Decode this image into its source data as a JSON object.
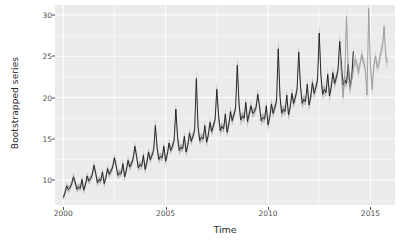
{
  "chart_data": {
    "type": "line",
    "title": "",
    "xlabel": "Time",
    "ylabel": "Bootstrapped series",
    "xlim": [
      1999.6,
      2016.2
    ],
    "ylim": [
      7.0,
      31.2
    ],
    "xticks": [
      2000,
      2005,
      2010,
      2015
    ],
    "xtick_labels": [
      "2000",
      "2005",
      "2010",
      "2015"
    ],
    "yticks": [
      10,
      15,
      20,
      25,
      30
    ],
    "ytick_labels": [
      "10",
      "15",
      "20",
      "25",
      "30"
    ],
    "grid": true,
    "grid_color": "#ffffff",
    "panel_background": "#ebebeb",
    "legend": "none",
    "series": [
      {
        "name": "observed",
        "color": "#1a1a1a",
        "ribbon_color": "#8c8c8c",
        "x_start": 2000.0,
        "x_end": 2013.5,
        "frequency": 12,
        "values": [
          7.9,
          8.4,
          9.3,
          8.9,
          9.1,
          9.6,
          10.4,
          9.8,
          8.9,
          9.2,
          9.0,
          10.1,
          8.8,
          9.4,
          10.5,
          9.9,
          10.2,
          10.6,
          11.8,
          10.9,
          9.7,
          10.1,
          9.9,
          11.0,
          9.6,
          10.3,
          11.4,
          10.7,
          11.1,
          11.6,
          12.7,
          11.8,
          10.6,
          10.9,
          10.8,
          12.0,
          10.4,
          11.2,
          12.4,
          11.6,
          12.0,
          12.6,
          14.1,
          12.9,
          11.5,
          11.9,
          11.7,
          13.0,
          11.3,
          12.1,
          13.4,
          12.5,
          13.0,
          13.6,
          16.6,
          14.0,
          12.5,
          12.9,
          12.7,
          14.1,
          12.3,
          13.1,
          14.5,
          13.6,
          14.1,
          14.8,
          18.6,
          15.2,
          13.6,
          14.0,
          13.8,
          15.3,
          13.4,
          14.2,
          15.7,
          14.7,
          15.3,
          16.0,
          22.3,
          16.5,
          14.8,
          15.2,
          15.0,
          16.6,
          14.6,
          15.4,
          17.0,
          15.9,
          16.6,
          17.3,
          21.0,
          17.9,
          16.0,
          16.5,
          16.2,
          18.0,
          15.8,
          16.7,
          18.3,
          17.2,
          17.9,
          18.7,
          23.9,
          19.3,
          17.3,
          17.8,
          17.5,
          19.4,
          17.1,
          18.0,
          19.0,
          18.1,
          18.3,
          18.8,
          20.4,
          19.0,
          17.2,
          17.6,
          17.4,
          19.0,
          16.7,
          17.6,
          19.2,
          18.1,
          18.8,
          19.6,
          25.9,
          20.2,
          18.1,
          18.6,
          18.3,
          20.3,
          17.9,
          18.8,
          20.5,
          19.3,
          20.0,
          20.9,
          25.5,
          21.5,
          19.3,
          19.8,
          19.5,
          21.6,
          19.1,
          20.0,
          21.8,
          20.5,
          21.2,
          22.1,
          27.8,
          22.7,
          20.4,
          21.0,
          20.6,
          22.8,
          20.2,
          21.2,
          23.0,
          21.7,
          22.4,
          23.3,
          26.8,
          23.9,
          21.5,
          22.1,
          21.7,
          24.0,
          21.3,
          22.3,
          25.6
        ]
      },
      {
        "name": "bootstrapped-forecast",
        "color": "#9a9a9a",
        "ribbon_color": "#b5b5b5",
        "x_start": 2013.5,
        "x_end": 2016.0,
        "frequency": 12,
        "values": [
          25.6,
          22.8,
          20.0,
          22.8,
          29.8,
          23.2,
          21.0,
          22.2,
          23.4,
          24.6,
          24.1,
          23.0,
          24.2,
          25.2,
          24.3,
          23.5,
          20.3,
          30.8,
          23.9,
          21.0,
          23.8,
          25.0,
          23.6,
          24.1,
          25.4,
          26.0,
          28.6,
          25.0,
          24.2
        ]
      }
    ],
    "annotations": []
  },
  "axes": {
    "y_label": "Bootstrapped series",
    "x_label": "Time"
  }
}
